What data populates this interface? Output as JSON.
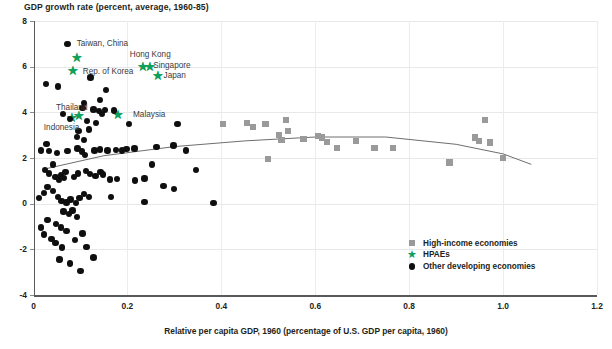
{
  "header": {
    "title": "GDP growth rate (percent, average, 1960-85)"
  },
  "axes": {
    "x_label": "Relative per capita GDP, 1960 (percentage of U.S. GDP per capita, 1960)",
    "y_label": "GDP growth rate (percent, average, 1960-85)",
    "x_ticks": [
      "0",
      "0.2",
      "0.4",
      "0.6",
      "0.8",
      "1.0",
      "1.2"
    ],
    "y_ticks": [
      "8",
      "6",
      "4",
      "2",
      "0",
      "-2",
      "-4"
    ]
  },
  "legend": {
    "position": "inside-bottom-right",
    "items": [
      {
        "label": "High-income economies",
        "marker": "square",
        "color": "#9a9a9a"
      },
      {
        "label": "HPAEs",
        "marker": "star",
        "color": "#10a05a"
      },
      {
        "label": "Other developing economies",
        "marker": "circle",
        "color": "#100f0f"
      }
    ]
  },
  "annotations": [
    {
      "text": "Taiwan, China",
      "x": 0.092,
      "y": 6.95,
      "anchor": "left"
    },
    {
      "text": "Hong Kong",
      "x": 0.205,
      "y": 6.5,
      "anchor": "left"
    },
    {
      "text": "Singapore",
      "x": 0.255,
      "y": 6.0,
      "anchor": "left"
    },
    {
      "text": "Japan",
      "x": 0.277,
      "y": 5.55,
      "anchor": "left"
    },
    {
      "text": "Rep. of Korea",
      "x": 0.105,
      "y": 5.75,
      "anchor": "left"
    },
    {
      "text": "Thailand",
      "x": 0.048,
      "y": 4.15,
      "anchor": "left"
    },
    {
      "text": "Malaysia",
      "x": 0.212,
      "y": 3.85,
      "anchor": "left"
    },
    {
      "text": "Indonesia",
      "x": 0.022,
      "y": 3.28,
      "anchor": "left"
    }
  ],
  "chart_data": {
    "type": "scatter",
    "title": "GDP growth rate (percent, average, 1960-85)",
    "xlabel": "Relative per capita GDP, 1960 (percentage of U.S. GDP per capita, 1960)",
    "ylabel": "GDP growth rate (percent, average, 1960-85)",
    "xlim": [
      0,
      1.2
    ],
    "ylim": [
      -4,
      8
    ],
    "xticks": [
      0,
      0.2,
      0.4,
      0.6,
      0.8,
      1.0,
      1.2
    ],
    "yticks": [
      -4,
      -2,
      0,
      2,
      4,
      6,
      8
    ],
    "grid": "both-light",
    "legend_position": "inside-bottom-right",
    "series": [
      {
        "name": "HPAEs",
        "marker": "star",
        "color": "#10a05a",
        "points": [
          {
            "label": "Taiwan, China",
            "x": 0.092,
            "y": 6.4
          },
          {
            "label": "Rep. of Korea",
            "x": 0.085,
            "y": 5.82
          },
          {
            "label": "Hong Kong",
            "x": 0.233,
            "y": 6.02
          },
          {
            "label": "Singapore",
            "x": 0.248,
            "y": 6.02
          },
          {
            "label": "Japan",
            "x": 0.265,
            "y": 5.6
          },
          {
            "label": "Thailand",
            "x": 0.096,
            "y": 3.87
          },
          {
            "label": "Indonesia",
            "x": 0.082,
            "y": 3.78
          },
          {
            "label": "Malaysia",
            "x": 0.181,
            "y": 3.9
          }
        ]
      },
      {
        "name": "High-income economies",
        "marker": "square",
        "color": "#9a9a9a",
        "points": [
          {
            "x": 0.404,
            "y": 3.48
          },
          {
            "x": 0.455,
            "y": 3.55
          },
          {
            "x": 0.467,
            "y": 3.35
          },
          {
            "x": 0.494,
            "y": 3.5
          },
          {
            "x": 0.523,
            "y": 3.0
          },
          {
            "x": 0.528,
            "y": 2.78
          },
          {
            "x": 0.538,
            "y": 3.68
          },
          {
            "x": 0.542,
            "y": 3.2
          },
          {
            "x": 0.575,
            "y": 2.82
          },
          {
            "x": 0.606,
            "y": 2.95
          },
          {
            "x": 0.614,
            "y": 2.9
          },
          {
            "x": 0.625,
            "y": 2.7
          },
          {
            "x": 0.646,
            "y": 2.45
          },
          {
            "x": 0.686,
            "y": 2.76
          },
          {
            "x": 0.726,
            "y": 2.45
          },
          {
            "x": 0.765,
            "y": 2.42
          },
          {
            "x": 0.5,
            "y": 1.95
          },
          {
            "x": 0.886,
            "y": 1.8
          },
          {
            "x": 0.94,
            "y": 2.9
          },
          {
            "x": 0.949,
            "y": 2.75
          },
          {
            "x": 0.962,
            "y": 3.68
          },
          {
            "x": 0.972,
            "y": 2.68
          },
          {
            "x": 1.0,
            "y": 2.0
          }
        ]
      },
      {
        "name": "Other developing economies",
        "marker": "circle",
        "color": "#100f0f",
        "points": [
          {
            "x": 0.072,
            "y": 6.98
          },
          {
            "x": 0.027,
            "y": 5.25
          },
          {
            "x": 0.052,
            "y": 5.13
          },
          {
            "x": 0.121,
            "y": 5.53
          },
          {
            "x": 0.155,
            "y": 4.98
          },
          {
            "x": 0.108,
            "y": 4.42
          },
          {
            "x": 0.142,
            "y": 4.55
          },
          {
            "x": 0.104,
            "y": 4.18
          },
          {
            "x": 0.128,
            "y": 4.12
          },
          {
            "x": 0.14,
            "y": 4.05
          },
          {
            "x": 0.152,
            "y": 4.1
          },
          {
            "x": 0.146,
            "y": 3.92
          },
          {
            "x": 0.171,
            "y": 4.08
          },
          {
            "x": 0.063,
            "y": 3.94
          },
          {
            "x": 0.078,
            "y": 3.72
          },
          {
            "x": 0.114,
            "y": 3.62
          },
          {
            "x": 0.133,
            "y": 3.52
          },
          {
            "x": 0.118,
            "y": 3.25
          },
          {
            "x": 0.096,
            "y": 3.18
          },
          {
            "x": 0.203,
            "y": 3.5
          },
          {
            "x": 0.307,
            "y": 3.48
          },
          {
            "x": 0.093,
            "y": 2.92
          },
          {
            "x": 0.108,
            "y": 2.78
          },
          {
            "x": 0.028,
            "y": 2.62
          },
          {
            "x": 0.016,
            "y": 2.32
          },
          {
            "x": 0.033,
            "y": 2.3
          },
          {
            "x": 0.05,
            "y": 2.22
          },
          {
            "x": 0.072,
            "y": 2.3
          },
          {
            "x": 0.094,
            "y": 2.42
          },
          {
            "x": 0.103,
            "y": 2.28
          },
          {
            "x": 0.11,
            "y": 2.12
          },
          {
            "x": 0.13,
            "y": 2.32
          },
          {
            "x": 0.142,
            "y": 2.38
          },
          {
            "x": 0.158,
            "y": 2.32
          },
          {
            "x": 0.176,
            "y": 2.35
          },
          {
            "x": 0.188,
            "y": 2.32
          },
          {
            "x": 0.198,
            "y": 2.4
          },
          {
            "x": 0.215,
            "y": 2.42
          },
          {
            "x": 0.262,
            "y": 2.48
          },
          {
            "x": 0.298,
            "y": 2.55
          },
          {
            "x": 0.325,
            "y": 2.32
          },
          {
            "x": 0.042,
            "y": 1.72
          },
          {
            "x": 0.024,
            "y": 1.48
          },
          {
            "x": 0.033,
            "y": 1.32
          },
          {
            "x": 0.047,
            "y": 1.18
          },
          {
            "x": 0.054,
            "y": 1.05
          },
          {
            "x": 0.058,
            "y": 1.25
          },
          {
            "x": 0.065,
            "y": 1.12
          },
          {
            "x": 0.068,
            "y": 1.38
          },
          {
            "x": 0.086,
            "y": 1.18
          },
          {
            "x": 0.095,
            "y": 1.32
          },
          {
            "x": 0.112,
            "y": 1.42
          },
          {
            "x": 0.12,
            "y": 1.3
          },
          {
            "x": 0.132,
            "y": 1.2
          },
          {
            "x": 0.143,
            "y": 1.4
          },
          {
            "x": 0.148,
            "y": 1.28
          },
          {
            "x": 0.163,
            "y": 1.05
          },
          {
            "x": 0.178,
            "y": 1.08
          },
          {
            "x": 0.216,
            "y": 1.02
          },
          {
            "x": 0.236,
            "y": 1.1
          },
          {
            "x": 0.253,
            "y": 1.72
          },
          {
            "x": 0.277,
            "y": 0.78
          },
          {
            "x": 0.299,
            "y": 0.65
          },
          {
            "x": 0.346,
            "y": 1.48
          },
          {
            "x": 0.236,
            "y": 0.08
          },
          {
            "x": 0.383,
            "y": 0.02
          },
          {
            "x": 0.03,
            "y": 0.72
          },
          {
            "x": 0.041,
            "y": 0.55
          },
          {
            "x": 0.022,
            "y": 0.48
          },
          {
            "x": 0.012,
            "y": 0.25
          },
          {
            "x": 0.052,
            "y": 0.3
          },
          {
            "x": 0.06,
            "y": 0.12
          },
          {
            "x": 0.07,
            "y": 0.05
          },
          {
            "x": 0.079,
            "y": 0.18
          },
          {
            "x": 0.09,
            "y": 0.02
          },
          {
            "x": 0.098,
            "y": 0.25
          },
          {
            "x": 0.108,
            "y": 0.42
          },
          {
            "x": 0.118,
            "y": 0.28
          },
          {
            "x": 0.165,
            "y": 0.3
          },
          {
            "x": 0.064,
            "y": -0.35
          },
          {
            "x": 0.075,
            "y": -0.45
          },
          {
            "x": 0.083,
            "y": -0.3
          },
          {
            "x": 0.093,
            "y": -0.58
          },
          {
            "x": 0.03,
            "y": -0.72
          },
          {
            "x": 0.048,
            "y": -0.88
          },
          {
            "x": 0.058,
            "y": -1.05
          },
          {
            "x": 0.07,
            "y": -1.2
          },
          {
            "x": 0.038,
            "y": -1.55
          },
          {
            "x": 0.047,
            "y": -1.72
          },
          {
            "x": 0.089,
            "y": -1.58
          },
          {
            "x": 0.104,
            "y": -1.3
          },
          {
            "x": 0.061,
            "y": -1.92
          },
          {
            "x": 0.113,
            "y": -1.9
          },
          {
            "x": 0.055,
            "y": -2.45
          },
          {
            "x": 0.078,
            "y": -2.62
          },
          {
            "x": 0.128,
            "y": -2.35
          },
          {
            "x": 0.1,
            "y": -2.95
          },
          {
            "x": 0.016,
            "y": -1.05
          },
          {
            "x": 0.022,
            "y": -1.35
          }
        ]
      }
    ],
    "trend_curve": {
      "name": "fitted quadratic trend",
      "color": "#6d6e71",
      "x_start": 0.02,
      "x_end": 1.06,
      "points": [
        {
          "x": 0.02,
          "y": 1.5
        },
        {
          "x": 0.15,
          "y": 2.1
        },
        {
          "x": 0.3,
          "y": 2.5
        },
        {
          "x": 0.45,
          "y": 2.75
        },
        {
          "x": 0.6,
          "y": 2.92
        },
        {
          "x": 0.75,
          "y": 2.92
        },
        {
          "x": 0.9,
          "y": 2.6
        },
        {
          "x": 1.0,
          "y": 2.18
        },
        {
          "x": 1.06,
          "y": 1.72
        }
      ]
    }
  }
}
